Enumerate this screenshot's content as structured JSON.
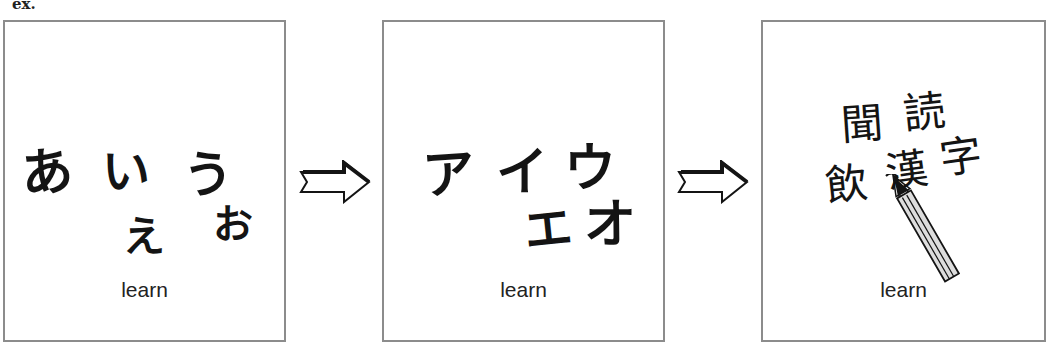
{
  "label": "ex.",
  "panels": [
    {
      "caption": "learn",
      "script_name": "hiragana",
      "characters": [
        "あ",
        "い",
        "う",
        "え",
        "お"
      ]
    },
    {
      "caption": "learn",
      "script_name": "katakana",
      "characters": [
        "ア",
        "イ",
        "ウ",
        "エ",
        "オ"
      ]
    },
    {
      "caption": "learn",
      "script_name": "kanji",
      "characters": [
        "聞",
        "読",
        "飲",
        "漢",
        "字"
      ]
    }
  ],
  "connectors": [
    {
      "icon": "right-arrow-icon"
    },
    {
      "icon": "right-arrow-icon"
    }
  ],
  "colors": {
    "border": "#8c8c8c",
    "ink": "#141414",
    "background": "#ffffff"
  }
}
